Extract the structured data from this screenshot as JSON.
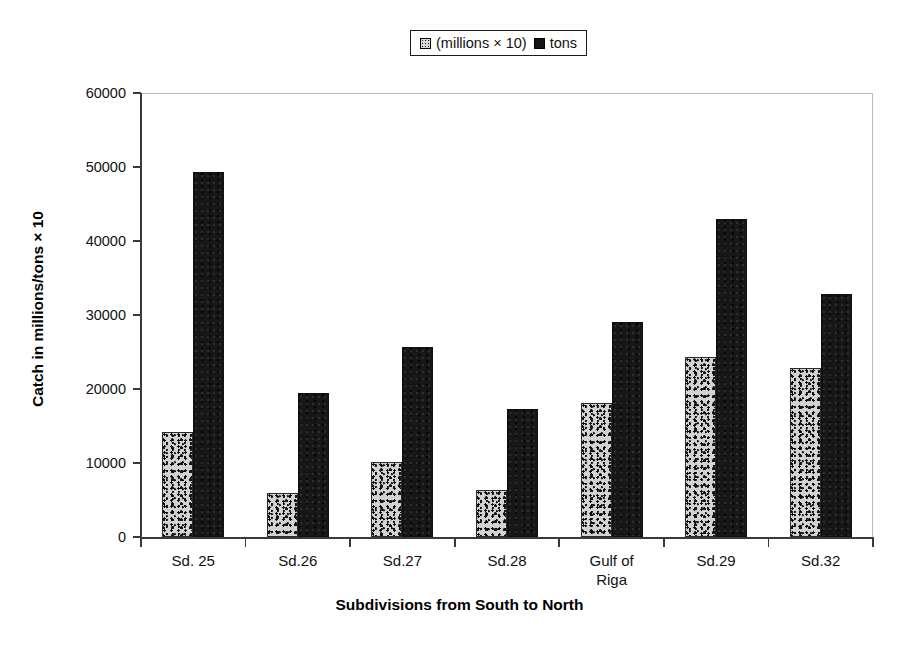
{
  "chart_data": {
    "type": "bar",
    "title": "",
    "xlabel": "Subdivisions from South to North",
    "ylabel": "Catch in millions/tons × 10",
    "categories": [
      "Sd. 25",
      "Sd.26",
      "Sd.27",
      "Sd.28",
      "Gulf of\nRiga",
      "Sd.29",
      "Sd.32"
    ],
    "series": [
      {
        "name": "(millions × 10)",
        "swatch": "speckled-gray",
        "color": "#d2d2d2",
        "values": [
          14200,
          6000,
          10200,
          6400,
          18100,
          24300,
          22900
        ]
      },
      {
        "name": "tons",
        "swatch": "solid-black",
        "color": "#171717",
        "values": [
          49300,
          19500,
          25700,
          17300,
          29000,
          43000,
          32800
        ]
      }
    ],
    "ylim": [
      0,
      60000
    ],
    "ytick_values": [
      0,
      10000,
      20000,
      30000,
      40000,
      50000,
      60000
    ],
    "ytick_labels": [
      "0",
      "10000",
      "20000",
      "30000",
      "40000",
      "50000",
      "60000"
    ],
    "grid": false,
    "legend_position": "top-center",
    "bar_group_count": 7,
    "series_count": 2
  },
  "legend": {
    "entries": [
      {
        "label": "(millions × 10)",
        "swatch": "speckled-gray"
      },
      {
        "label": "tons",
        "swatch": "solid-black"
      }
    ]
  },
  "axes": {
    "y_title": "Catch in millions/tons × 10",
    "x_title": "Subdivisions from South to North"
  }
}
